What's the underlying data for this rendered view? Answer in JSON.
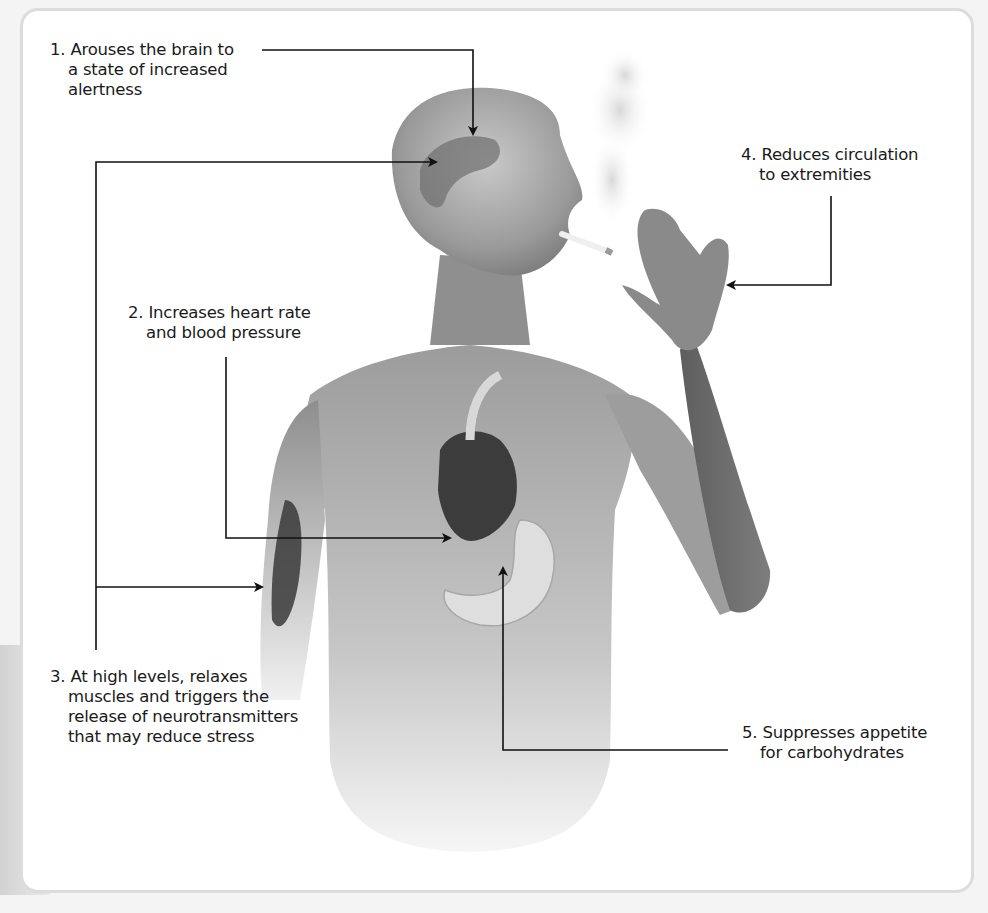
{
  "figure": {
    "illustration": "grayscale-man-smoking-cigarette-with-anatomical-overlay",
    "colors": {
      "line": "#111111",
      "panel_border": "#dcdcdc",
      "text": "#1a1a1a",
      "skin_dark": "#5a5a5a",
      "skin_light": "#bdbdbd"
    }
  },
  "callouts": [
    {
      "number": "1.",
      "lines": [
        "Arouses the brain to",
        "a state of increased",
        "alertness"
      ],
      "target": "brain"
    },
    {
      "number": "2.",
      "lines": [
        "Increases heart rate",
        "and blood pressure"
      ],
      "target": "heart"
    },
    {
      "number": "3.",
      "lines": [
        "At high levels, relaxes",
        "muscles and triggers the",
        "release of neurotransmitters",
        "that may reduce stress"
      ],
      "target": "brain-and-arm-muscle"
    },
    {
      "number": "4.",
      "lines": [
        "Reduces circulation",
        "to extremities"
      ],
      "target": "hand"
    },
    {
      "number": "5.",
      "lines": [
        "Suppresses appetite",
        "for carbohydrates"
      ],
      "target": "stomach"
    }
  ]
}
